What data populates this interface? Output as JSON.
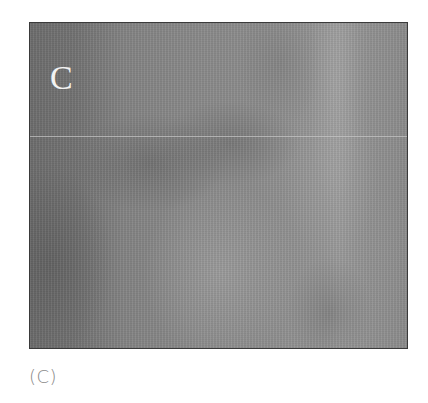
{
  "figure": {
    "panel_label": "C",
    "caption": "(C)",
    "image_description": "grayscale-medical-scan",
    "colors": {
      "frame_border": "#3a3a3a",
      "panel_label": "#f2f2f2",
      "caption": "#888888",
      "scan_dark": "#6d6d6d",
      "scan_mid": "#8a8a8a",
      "scan_light": "#9b9b9b"
    }
  }
}
